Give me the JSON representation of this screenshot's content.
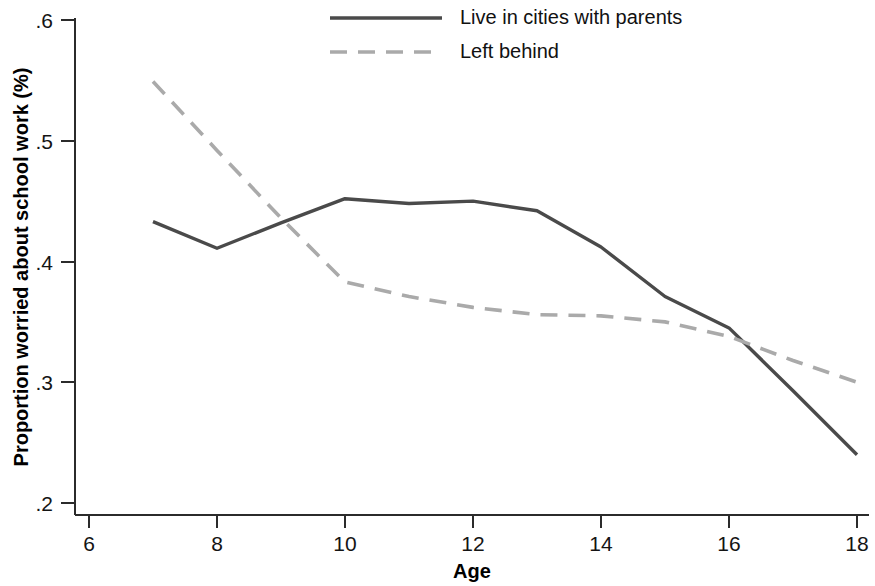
{
  "chart_data": {
    "type": "line",
    "title": "",
    "xlabel": "Age",
    "ylabel": "Proportion worried about school work (%)",
    "xlim": [
      6,
      18
    ],
    "ylim": [
      0.2,
      0.6
    ],
    "xticks": [
      6,
      8,
      10,
      12,
      14,
      16,
      18
    ],
    "xtick_labels": [
      "6",
      "8",
      "10",
      "12",
      "14",
      "16",
      "18"
    ],
    "yticks": [
      0.2,
      0.3,
      0.4,
      0.5,
      0.6
    ],
    "ytick_labels": [
      ".2",
      ".3",
      ".4",
      ".5",
      ".6"
    ],
    "grid": false,
    "legend_position": "top-center",
    "x": [
      7,
      8,
      9,
      10,
      11,
      12,
      13,
      14,
      15,
      16,
      17,
      18
    ],
    "series": [
      {
        "name": "Live in cities with parents",
        "style": "solid",
        "color": "#4a4a4a",
        "values": [
          0.433,
          0.411,
          0.432,
          0.452,
          0.448,
          0.45,
          0.442,
          0.412,
          0.371,
          0.345,
          0.293,
          0.24
        ]
      },
      {
        "name": "Left behind",
        "style": "dashed",
        "color": "#aaaaaa",
        "values": [
          0.549,
          0.492,
          0.436,
          0.383,
          0.371,
          0.362,
          0.356,
          0.355,
          0.35,
          0.338,
          0.318,
          0.3
        ]
      }
    ]
  },
  "legend": {
    "entries": [
      {
        "label": "Live in cities with parents"
      },
      {
        "label": "Left behind"
      }
    ]
  }
}
